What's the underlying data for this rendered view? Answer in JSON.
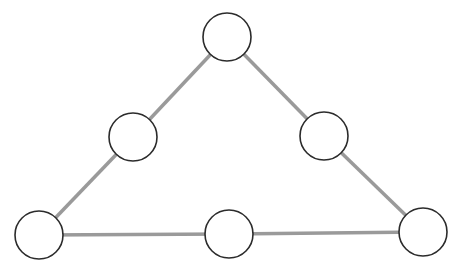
{
  "diagram": {
    "type": "graph",
    "nodes": [
      {
        "id": "top",
        "label": ""
      },
      {
        "id": "left-mid",
        "label": ""
      },
      {
        "id": "right-mid",
        "label": ""
      },
      {
        "id": "bottom-left",
        "label": ""
      },
      {
        "id": "bottom-mid",
        "label": ""
      },
      {
        "id": "bottom-right",
        "label": ""
      }
    ],
    "edges": [
      {
        "from": "top",
        "to": "left-mid"
      },
      {
        "from": "left-mid",
        "to": "bottom-left"
      },
      {
        "from": "top",
        "to": "right-mid"
      },
      {
        "from": "right-mid",
        "to": "bottom-right"
      },
      {
        "from": "bottom-left",
        "to": "bottom-mid"
      },
      {
        "from": "bottom-mid",
        "to": "bottom-right"
      }
    ],
    "colors": {
      "edge": "#9a9a9a",
      "node_stroke": "#2b2b2b",
      "node_fill": "#ffffff"
    }
  }
}
